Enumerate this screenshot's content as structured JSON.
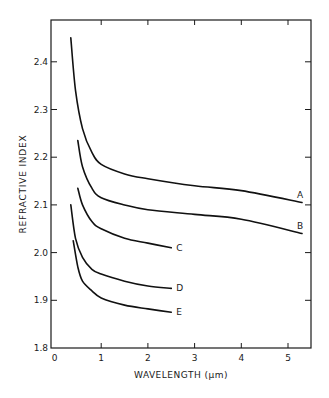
{
  "chart_data": {
    "type": "line",
    "title": "",
    "xlabel": "WAVELENGTH (μm)",
    "ylabel": "REFRACTIVE INDEX",
    "xlim": [
      0,
      5.5
    ],
    "ylim": [
      1.8,
      2.5
    ],
    "xticks": [
      0,
      1,
      2,
      3,
      4,
      5
    ],
    "xtick_labels": [
      "0",
      "1",
      "2",
      "3",
      "4",
      "5"
    ],
    "yticks": [
      1.8,
      1.9,
      2.0,
      2.1,
      2.2,
      2.3,
      2.4
    ],
    "ytick_labels": [
      "1.8",
      "1.9",
      "2.0",
      "2.1",
      "2.2",
      "2.3",
      "2.4"
    ],
    "grid": false,
    "legend": "inline curve labels at right end of each curve",
    "series": [
      {
        "name": "A",
        "x": [
          0.35,
          0.45,
          0.6,
          0.8,
          1.0,
          1.5,
          2.0,
          3.0,
          4.0,
          5.3
        ],
        "y": [
          2.45,
          2.34,
          2.26,
          2.21,
          2.185,
          2.165,
          2.155,
          2.14,
          2.13,
          2.105
        ]
      },
      {
        "name": "B",
        "x": [
          0.5,
          0.6,
          0.8,
          1.0,
          1.5,
          2.0,
          3.0,
          4.0,
          5.3
        ],
        "y": [
          2.235,
          2.18,
          2.135,
          2.115,
          2.1,
          2.09,
          2.08,
          2.07,
          2.04
        ]
      },
      {
        "name": "C",
        "x": [
          0.5,
          0.6,
          0.8,
          1.0,
          1.5,
          2.0,
          2.5
        ],
        "y": [
          2.135,
          2.1,
          2.065,
          2.05,
          2.03,
          2.02,
          2.01
        ]
      },
      {
        "name": "D",
        "x": [
          0.35,
          0.45,
          0.6,
          0.8,
          1.0,
          1.5,
          2.0,
          2.5
        ],
        "y": [
          2.1,
          2.03,
          1.99,
          1.965,
          1.955,
          1.94,
          1.93,
          1.925
        ]
      },
      {
        "name": "E",
        "x": [
          0.4,
          0.5,
          0.6,
          0.8,
          1.0,
          1.5,
          2.0,
          2.5
        ],
        "y": [
          2.025,
          1.97,
          1.94,
          1.92,
          1.905,
          1.89,
          1.882,
          1.875
        ]
      }
    ]
  },
  "labels": {
    "xlabel": "WAVELENGTH (μm)",
    "ylabel": "REFRACTIVE INDEX"
  }
}
